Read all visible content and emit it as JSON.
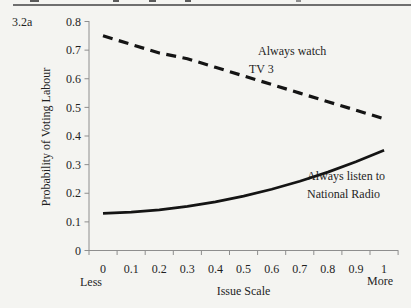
{
  "colors": {
    "background": "#f4f4f1",
    "series_line": "#141414",
    "axis": "#8e8e8e",
    "text": "#1f1f1f",
    "top_rule": "#6f6f6f"
  },
  "chart_data": {
    "type": "line",
    "panel_label": "3.2a",
    "title": "",
    "xlabel": "Issue Scale",
    "ylabel": "Probability of Voting Labour",
    "x_end_captions": {
      "left": "Less",
      "right": "More"
    },
    "x": [
      0,
      0.1,
      0.2,
      0.3,
      0.4,
      0.5,
      0.6,
      0.7,
      0.8,
      0.9,
      1
    ],
    "x_tick_labels": [
      "0",
      "0.1",
      "0.2",
      "0.3",
      "0.4",
      "0.5",
      "0.6",
      "0.7",
      "0.8",
      "0.9",
      "1"
    ],
    "y_tick_labels": [
      "0",
      "0.1",
      "0.2",
      "0.3",
      "0.4",
      "0.5",
      "0.6",
      "0.7",
      "0.8"
    ],
    "ylim": [
      0,
      0.8
    ],
    "xlim": [
      0,
      1
    ],
    "grid": "off",
    "legend_position": "inline-annotations",
    "series": [
      {
        "name": "Always watch TV 3",
        "line_style": "dashed",
        "color": "#141414",
        "values": [
          0.75,
          0.72,
          0.69,
          0.67,
          0.64,
          0.61,
          0.58,
          0.55,
          0.52,
          0.49,
          0.46
        ]
      },
      {
        "name": "Always listen to National Radio",
        "line_style": "solid",
        "color": "#141414",
        "values": [
          0.13,
          0.134,
          0.142,
          0.154,
          0.17,
          0.19,
          0.214,
          0.242,
          0.274,
          0.31,
          0.35
        ]
      }
    ],
    "annotations": [
      {
        "lines": [
          "Always watch",
          "TV 3"
        ]
      },
      {
        "lines": [
          "Always listen to",
          "National Radio"
        ]
      }
    ]
  }
}
